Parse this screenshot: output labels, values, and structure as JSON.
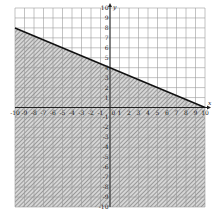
{
  "chart_data": {
    "type": "line",
    "title": "",
    "xlabel": "x",
    "ylabel": "y",
    "xlim": [
      -10,
      10
    ],
    "ylim": [
      -10,
      10
    ],
    "grid": true,
    "x_ticks": [
      -10,
      -9,
      -8,
      -7,
      -6,
      -5,
      -4,
      -3,
      -2,
      -1,
      1,
      2,
      3,
      4,
      5,
      6,
      7,
      8,
      9,
      10
    ],
    "y_ticks": [
      -10,
      -9,
      -8,
      -7,
      -6,
      -5,
      -4,
      -3,
      -2,
      -1,
      1,
      2,
      3,
      4,
      5,
      6,
      7,
      8,
      9,
      10
    ],
    "origin_label": "0",
    "series": [
      {
        "name": "boundary line",
        "style": "solid",
        "points": [
          [
            -10,
            8
          ],
          [
            0,
            4
          ],
          [
            10,
            0
          ]
        ],
        "equation": "y = -2/5 x + 4"
      }
    ],
    "shaded_region": {
      "description": "below the line (y <= -2/5 x + 4)",
      "pattern": "diagonal hatch",
      "color": "#888888"
    }
  },
  "colors": {
    "grid": "#9a9a9a",
    "axis": "#222222",
    "line": "#111111",
    "hatch": "#7a7a7a"
  }
}
